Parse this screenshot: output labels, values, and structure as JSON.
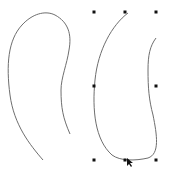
{
  "canvas": {
    "background": "#ffffff",
    "stroke_color": "#6e6e6e",
    "handle_color": "#111111"
  },
  "shapes": [
    {
      "name": "freehand-curve-left",
      "selected": false,
      "path": "M43,160 C30,145 14,125 10,95 C6,65 8,40 22,25 C32,14 45,10 55,15 C68,22 72,34 69,50 C67,64 61,78 61,90 C61,108 63,118 70,134"
    },
    {
      "name": "freehand-curve-right",
      "selected": true,
      "path": "M128,13 C112,25 98,50 95,80 C92,110 95,140 112,155 C120,161 135,161 148,158 C160,154 157,135 153,115 C149,100 148,88 148,70 C148,55 150,46 156,38"
    }
  ],
  "selection": {
    "handles": [
      {
        "x": 94,
        "y": 12
      },
      {
        "x": 125,
        "y": 12
      },
      {
        "x": 156,
        "y": 12
      },
      {
        "x": 94,
        "y": 86
      },
      {
        "x": 156,
        "y": 86
      },
      {
        "x": 94,
        "y": 160
      },
      {
        "x": 125,
        "y": 160
      },
      {
        "x": 156,
        "y": 160
      }
    ]
  },
  "cursor": {
    "type": "arrow",
    "x": 127,
    "y": 158
  }
}
